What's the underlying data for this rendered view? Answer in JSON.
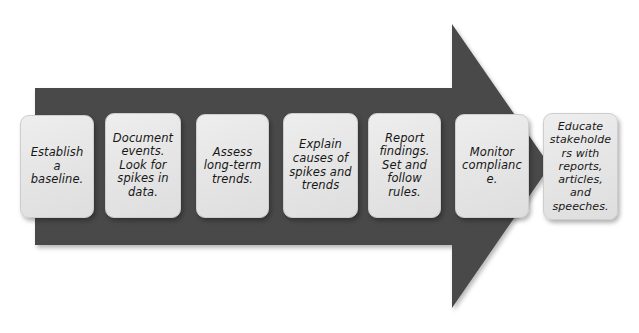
{
  "diagram": {
    "type": "process-arrow",
    "title": "",
    "direction": "left-to-right",
    "step_count": 7,
    "colors": {
      "arrow_fill": "#4a4a4a",
      "box_fill": "#e7e7e7",
      "box_border": "#cdcdcd",
      "text": "#171717",
      "background": "#ffffff"
    },
    "arrow": {
      "name": "process-arrow-shape",
      "body_left": 35,
      "body_top": 88,
      "body_right": 452,
      "body_bottom": 245,
      "head_top": 24,
      "head_bottom": 308,
      "tip_x": 550,
      "tip_y": 166
    },
    "steps": [
      {
        "index": 1,
        "name": "step-establish-baseline",
        "text": "Establish a baseline.",
        "x": 20,
        "y": 115,
        "w": 74,
        "h": 103
      },
      {
        "index": 2,
        "name": "step-document-events",
        "text": "Document events. Look for spikes in data.",
        "x": 105,
        "y": 113,
        "w": 76,
        "h": 105
      },
      {
        "index": 3,
        "name": "step-assess-trends",
        "text": "Assess long-term trends.",
        "x": 196,
        "y": 114,
        "w": 73,
        "h": 104
      },
      {
        "index": 4,
        "name": "step-explain-causes",
        "text": "Explain causes of spikes and trends",
        "x": 283,
        "y": 113,
        "w": 75,
        "h": 105
      },
      {
        "index": 5,
        "name": "step-report-findings",
        "text": "Report findings. Set and follow rules.",
        "x": 368,
        "y": 113,
        "w": 73,
        "h": 105
      },
      {
        "index": 6,
        "name": "step-monitor-compliance",
        "text": "Monitor compliance.",
        "x": 455,
        "y": 114,
        "w": 74,
        "h": 104
      },
      {
        "index": 7,
        "name": "step-educate-stakeholders",
        "text": "Educate stakeholders with reports, articles, and speeches.",
        "x": 543,
        "y": 113,
        "w": 75,
        "h": 107
      }
    ]
  }
}
